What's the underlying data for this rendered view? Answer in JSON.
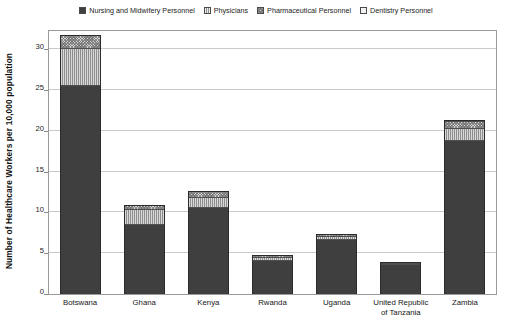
{
  "chart_data": {
    "type": "bar",
    "subtype": "stacked-vertical",
    "title": "",
    "xlabel": "",
    "ylabel": "Number of Healthcare Workers per 10,000 population",
    "ylim": [
      0,
      32.5
    ],
    "yticks": [
      0,
      5,
      10,
      15,
      20,
      25,
      30
    ],
    "ytick_labels": [
      "0",
      "5",
      "10",
      "15",
      "20",
      "25",
      "30"
    ],
    "grid": true,
    "grid_axis": "y",
    "legend_position": "top-center",
    "categories": [
      "Botswana",
      "Ghana",
      "Kenya",
      "Rwanda",
      "Uganda",
      "United Republic of Tanzania",
      "Zambia"
    ],
    "category_label_lines": [
      [
        "Botswana"
      ],
      [
        "Ghana"
      ],
      [
        "Kenya"
      ],
      [
        "Rwanda"
      ],
      [
        "Uganda"
      ],
      [
        "United Republic",
        "of Tanzania"
      ],
      [
        "Zambia"
      ]
    ],
    "series": [
      {
        "name": "Nursing and Midwifery Personnel",
        "color": "#3f3f3f",
        "pattern": "solid",
        "values": [
          25.5,
          8.5,
          10.5,
          4.1,
          6.6,
          3.6,
          18.8
        ]
      },
      {
        "name": "Physicians",
        "color": "#8e8e8e",
        "pattern": "vertical-lines",
        "values": [
          4.5,
          1.8,
          1.3,
          0.3,
          0.4,
          0.05,
          1.4
        ]
      },
      {
        "name": "Pharmaceutical Personnel",
        "color": "#d6d6d6",
        "pattern": "cross-hatch",
        "values": [
          1.6,
          0.5,
          0.7,
          0.3,
          0.3,
          0.05,
          0.9
        ]
      },
      {
        "name": "Dentistry Personnel",
        "color": "#f4f4f4",
        "pattern": "solid-light",
        "values": [
          0.0,
          0.0,
          0.0,
          0.0,
          0.0,
          0.0,
          0.1
        ]
      }
    ],
    "totals": [
      31.6,
      10.8,
      12.5,
      4.7,
      7.3,
      3.7,
      21.2
    ]
  },
  "legend": {
    "items": [
      {
        "label": "Nursing and Midwifery Personnel",
        "swatch": "nursing-swatch"
      },
      {
        "label": "Physicians",
        "swatch": "physicians-swatch"
      },
      {
        "label": "Pharmaceutical Personnel",
        "swatch": "pharmaceutical-swatch"
      },
      {
        "label": "Dentistry Personnel",
        "swatch": "dentistry-swatch"
      }
    ]
  }
}
